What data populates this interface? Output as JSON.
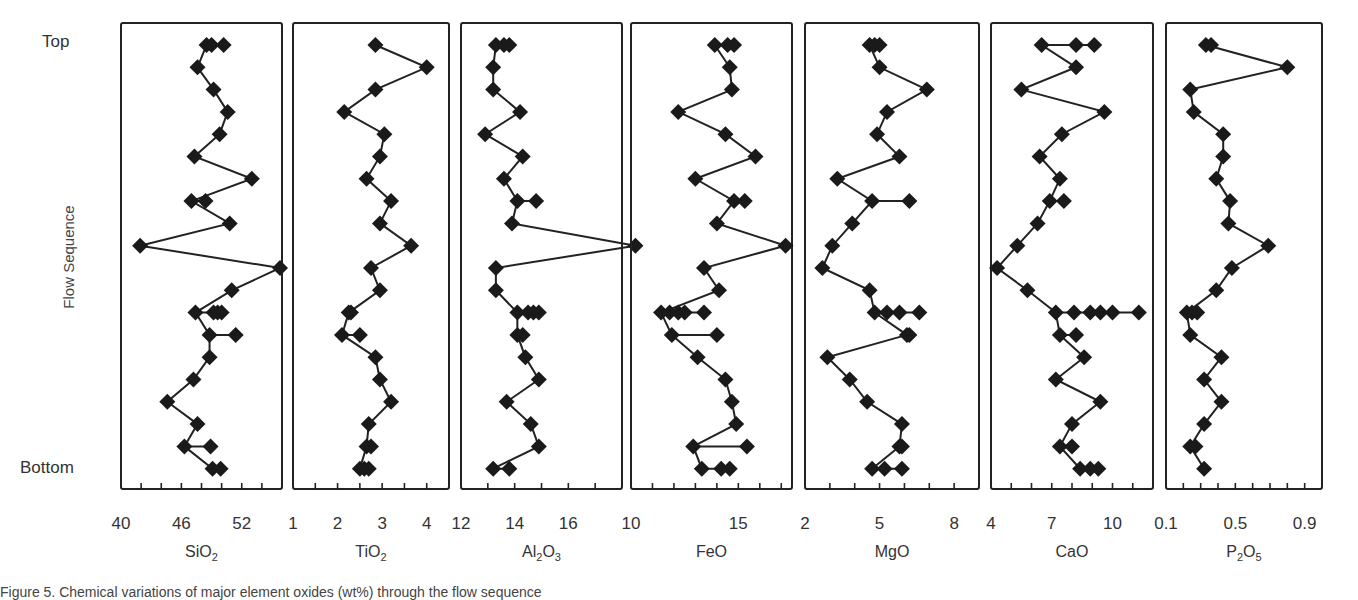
{
  "figure": {
    "y_axis_label": "Flow Sequence",
    "y_top_label": "Top",
    "y_bottom_label": "Bottom",
    "caption": "Figure 5. Chemical variations of major element oxides (wt%) through the flow sequence"
  },
  "chart_data": {
    "type": "line",
    "title": "",
    "ylabel": "Flow Sequence",
    "y_categories_top_to_bottom": [
      "Top",
      "",
      "",
      "",
      "",
      "",
      "",
      "",
      "",
      "",
      "",
      "",
      "",
      "",
      "",
      "",
      "",
      "",
      "",
      "Bottom"
    ],
    "row_count": 20,
    "marker": "diamond",
    "line_color": "#222222",
    "marker_color": "#1a1a1a",
    "panels": [
      {
        "name": "SiO2",
        "xlabel": "SiO",
        "xlabel_sub": "2",
        "xlabel_tail": "",
        "xlim": [
          40,
          56
        ],
        "tick_labels": [
          "40",
          "46",
          "52"
        ],
        "tick_values": [
          40,
          46,
          52
        ],
        "minor_step": 2,
        "rows": [
          [
            48.5,
            49.0,
            50.2
          ],
          [
            47.6
          ],
          [
            49.2
          ],
          [
            50.6
          ],
          [
            49.8
          ],
          [
            47.3
          ],
          [
            53.0
          ],
          [
            47.0,
            48.4
          ],
          [
            50.8
          ],
          [
            41.9
          ],
          [
            55.8
          ],
          [
            51.0
          ],
          [
            47.4,
            49.2,
            49.6,
            50.0
          ],
          [
            48.8,
            51.4
          ],
          [
            48.8
          ],
          [
            47.2
          ],
          [
            44.6
          ],
          [
            47.6
          ],
          [
            46.3,
            48.9
          ],
          [
            49.1,
            49.9
          ]
        ]
      },
      {
        "name": "TiO2",
        "xlabel": "TiO",
        "xlabel_sub": "2",
        "xlabel_tail": "",
        "xlim": [
          1,
          4.5
        ],
        "tick_labels": [
          "1",
          "2",
          "3",
          "4"
        ],
        "tick_values": [
          1,
          2,
          3,
          4
        ],
        "minor_step": 0.5,
        "rows": [
          [
            2.85
          ],
          [
            4.0
          ],
          [
            2.85
          ],
          [
            2.15
          ],
          [
            3.05
          ],
          [
            2.95
          ],
          [
            2.65
          ],
          [
            3.2
          ],
          [
            2.95
          ],
          [
            3.65
          ],
          [
            2.75
          ],
          [
            2.95
          ],
          [
            2.25,
            2.3
          ],
          [
            2.1,
            2.5
          ],
          [
            2.85
          ],
          [
            2.95
          ],
          [
            3.2
          ],
          [
            2.7
          ],
          [
            2.65,
            2.75
          ],
          [
            2.5,
            2.6,
            2.7
          ]
        ]
      },
      {
        "name": "Al2O3",
        "xlabel": "Al",
        "xlabel_sub": "2",
        "xlabel_tail": "O3",
        "xlim": [
          12,
          18
        ],
        "tick_labels": [
          "12",
          "14",
          "16"
        ],
        "tick_values": [
          12,
          14,
          16
        ],
        "minor_step": 1,
        "rows": [
          [
            13.3,
            13.6,
            13.8
          ],
          [
            13.2
          ],
          [
            13.2
          ],
          [
            14.2
          ],
          [
            12.9
          ],
          [
            14.3
          ],
          [
            13.6
          ],
          [
            14.1,
            14.8
          ],
          [
            13.9
          ],
          [
            18.5
          ],
          [
            13.3
          ],
          [
            13.3
          ],
          [
            14.1,
            14.5,
            14.7,
            14.9
          ],
          [
            14.1,
            14.3
          ],
          [
            14.4
          ],
          [
            14.9
          ],
          [
            13.7
          ],
          [
            14.6
          ],
          [
            14.9
          ],
          [
            13.2,
            13.8
          ]
        ]
      },
      {
        "name": "FeO",
        "xlabel": "FeO",
        "xlabel_sub": "",
        "xlabel_tail": "",
        "xlim": [
          10,
          17.5
        ],
        "tick_labels": [
          "10",
          "15"
        ],
        "tick_values": [
          10,
          15
        ],
        "minor_step": 1,
        "rows": [
          [
            13.9,
            14.5,
            14.8
          ],
          [
            14.6
          ],
          [
            14.7
          ],
          [
            12.2
          ],
          [
            14.4
          ],
          [
            15.8
          ],
          [
            13.0
          ],
          [
            14.8,
            15.3
          ],
          [
            14.0
          ],
          [
            17.2
          ],
          [
            13.4
          ],
          [
            14.1
          ],
          [
            11.4,
            11.8,
            12.2,
            12.5,
            13.4
          ],
          [
            11.9,
            14.0
          ],
          [
            13.1
          ],
          [
            14.4
          ],
          [
            14.7
          ],
          [
            14.9
          ],
          [
            12.9,
            15.4
          ],
          [
            13.3,
            14.2,
            14.6
          ]
        ]
      },
      {
        "name": "MgO",
        "xlabel": "MgO",
        "xlabel_sub": "",
        "xlabel_tail": "",
        "xlim": [
          2,
          9
        ],
        "tick_labels": [
          "2",
          "5",
          "8"
        ],
        "tick_values": [
          2,
          5,
          8
        ],
        "minor_step": 1,
        "rows": [
          [
            4.6,
            4.8,
            5.0
          ],
          [
            5.0
          ],
          [
            6.9
          ],
          [
            5.3
          ],
          [
            4.9
          ],
          [
            5.8
          ],
          [
            3.3
          ],
          [
            4.7,
            6.2
          ],
          [
            3.9
          ],
          [
            3.1
          ],
          [
            2.7
          ],
          [
            4.6
          ],
          [
            4.8,
            5.3,
            5.8,
            6.6
          ],
          [
            6.1,
            6.2
          ],
          [
            2.9
          ],
          [
            3.8
          ],
          [
            4.5
          ],
          [
            5.9
          ],
          [
            5.8,
            5.9
          ],
          [
            4.7,
            5.2,
            5.9
          ]
        ]
      },
      {
        "name": "CaO",
        "xlabel": "CaO",
        "xlabel_sub": "",
        "xlabel_tail": "",
        "xlim": [
          4,
          12
        ],
        "tick_labels": [
          "4",
          "7",
          "10"
        ],
        "tick_values": [
          4,
          7,
          10
        ],
        "minor_step": 1,
        "rows": [
          [
            6.5,
            8.2,
            9.1
          ],
          [
            8.2
          ],
          [
            5.5
          ],
          [
            9.6
          ],
          [
            7.5
          ],
          [
            6.4
          ],
          [
            7.4
          ],
          [
            6.9,
            7.6
          ],
          [
            6.3
          ],
          [
            5.3
          ],
          [
            4.3
          ],
          [
            5.8
          ],
          [
            7.2,
            8.1,
            8.9,
            9.4,
            10.0,
            11.3
          ],
          [
            7.4,
            8.2
          ],
          [
            8.6
          ],
          [
            7.2
          ],
          [
            9.4
          ],
          [
            8.0
          ],
          [
            7.4,
            8.0
          ],
          [
            8.4,
            8.9,
            9.3
          ]
        ]
      },
      {
        "name": "P2O5",
        "xlabel": "P",
        "xlabel_sub": "2",
        "xlabel_tail": "O5",
        "xlim": [
          0.1,
          1.0
        ],
        "tick_labels": [
          "0.1",
          "0.5",
          "0.9"
        ],
        "tick_values": [
          0.1,
          0.5,
          0.9
        ],
        "minor_step": 0.1,
        "rows": [
          [
            0.33,
            0.36
          ],
          [
            0.8
          ],
          [
            0.24
          ],
          [
            0.26
          ],
          [
            0.43
          ],
          [
            0.43
          ],
          [
            0.39
          ],
          [
            0.47
          ],
          [
            0.46
          ],
          [
            0.69
          ],
          [
            0.48
          ],
          [
            0.39
          ],
          [
            0.22,
            0.25,
            0.28
          ],
          [
            0.24
          ],
          [
            0.42
          ],
          [
            0.32
          ],
          [
            0.42
          ],
          [
            0.32
          ],
          [
            0.24,
            0.27
          ],
          [
            0.32
          ]
        ]
      }
    ]
  },
  "layout": {
    "panels_px": [
      {
        "left": 121,
        "right": 282
      },
      {
        "left": 293,
        "right": 449
      },
      {
        "left": 461,
        "right": 622
      },
      {
        "left": 631,
        "right": 792
      },
      {
        "left": 805,
        "right": 979
      },
      {
        "left": 991,
        "right": 1153
      },
      {
        "left": 1166,
        "right": 1322
      }
    ],
    "top_px": 23,
    "bottom_px": 489,
    "first_row_y": 45,
    "row_spacing": 22.3
  }
}
